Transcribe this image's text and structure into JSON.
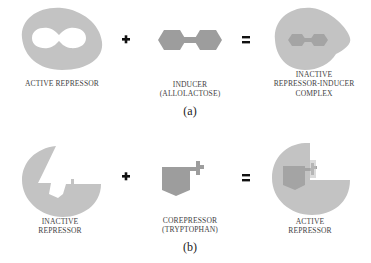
{
  "colors": {
    "protein": "#c3c3c3",
    "ligand": "#9d9d9d",
    "complex_inner": "#a4a4a4",
    "text": "#444444",
    "background": "#ffffff"
  },
  "panel_a": {
    "caption": "(a)",
    "plus": "+",
    "equals": "=",
    "items": [
      {
        "name": "active-repressor",
        "label_lines": [
          "ACTIVE REPRESSOR"
        ]
      },
      {
        "name": "inducer",
        "label_lines": [
          "INDUCER",
          "(ALLOLACTOSE)"
        ]
      },
      {
        "name": "inactive-complex",
        "label_lines": [
          "INACTIVE",
          "REPRESSOR-INDUCER",
          "COMPLEX"
        ]
      }
    ]
  },
  "panel_b": {
    "caption": "(b)",
    "plus": "+",
    "equals": "=",
    "items": [
      {
        "name": "inactive-repressor",
        "label_lines": [
          "INACTIVE",
          "REPRESSOR"
        ]
      },
      {
        "name": "corepressor",
        "label_lines": [
          "COREPRESSOR",
          "(TRYPTOPHAN)"
        ]
      },
      {
        "name": "active-repressor",
        "label_lines": [
          "ACTIVE",
          "REPRESSOR"
        ]
      }
    ]
  }
}
